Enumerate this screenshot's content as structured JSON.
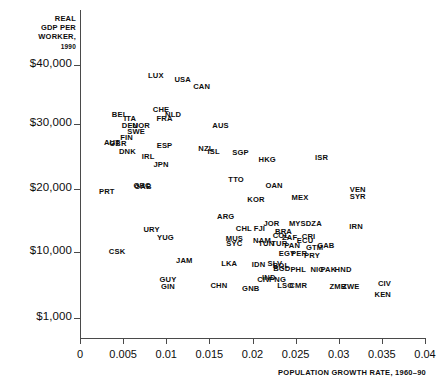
{
  "chart_data": {
    "type": "scatter",
    "title": "",
    "ylabel": "REAL GDP PER WORKER, 1990",
    "ylabel_lines": [
      "REAL",
      "GDP PER",
      "WORKER,"
    ],
    "ylabel_year": "1990",
    "xlabel": "POPULATION GROWTH RATE, 1960–90",
    "xlim": [
      0,
      0.04
    ],
    "ylim": [
      1000,
      40000
    ],
    "grid": false,
    "legend": "none",
    "xticks": [
      0,
      0.005,
      0.01,
      0.015,
      0.02,
      0.025,
      0.03,
      0.035,
      0.04
    ],
    "xticklabels": [
      "0",
      "0.005",
      "0.01",
      "0.015",
      "0.02",
      "0.025",
      "0.03",
      "0.035",
      "0.04"
    ],
    "yticks": [
      40000,
      30000,
      20000,
      10000,
      1000
    ],
    "yticklabels": [
      "$40,000",
      "$30,000",
      "$20,000",
      "$10,000",
      "$1,000"
    ],
    "marker_style": "text-label",
    "points": [
      {
        "label": "LUX",
        "x": 0.0088,
        "y": 38200
      },
      {
        "label": "USA",
        "x": 0.0119,
        "y": 37400
      },
      {
        "label": "CAN",
        "x": 0.0141,
        "y": 36300
      },
      {
        "label": "CHE",
        "x": 0.0094,
        "y": 32300
      },
      {
        "label": "BEL",
        "x": 0.0046,
        "y": 31500
      },
      {
        "label": "NLD",
        "x": 0.0108,
        "y": 31600
      },
      {
        "label": "ITA",
        "x": 0.0058,
        "y": 30900
      },
      {
        "label": "FRA",
        "x": 0.0098,
        "y": 30800
      },
      {
        "label": "DEU",
        "x": 0.0058,
        "y": 29700
      },
      {
        "label": "NOR",
        "x": 0.0071,
        "y": 29700
      },
      {
        "label": "SWE",
        "x": 0.0065,
        "y": 28800
      },
      {
        "label": "FIN",
        "x": 0.0054,
        "y": 27900
      },
      {
        "label": "AUT",
        "x": 0.0037,
        "y": 27100
      },
      {
        "label": "GBR",
        "x": 0.0044,
        "y": 27000
      },
      {
        "label": "ESP",
        "x": 0.0098,
        "y": 26600
      },
      {
        "label": "DNK",
        "x": 0.0055,
        "y": 25700
      },
      {
        "label": "AUS",
        "x": 0.0163,
        "y": 29700
      },
      {
        "label": "IRL",
        "x": 0.0079,
        "y": 24900
      },
      {
        "label": "NZL",
        "x": 0.0146,
        "y": 26100
      },
      {
        "label": "ISL",
        "x": 0.0155,
        "y": 25700
      },
      {
        "label": "SGP",
        "x": 0.0186,
        "y": 25600
      },
      {
        "label": "JPN",
        "x": 0.0094,
        "y": 23700
      },
      {
        "label": "HKG",
        "x": 0.0217,
        "y": 24400
      },
      {
        "label": "ISR",
        "x": 0.028,
        "y": 24700
      },
      {
        "label": "TTO",
        "x": 0.0181,
        "y": 21400
      },
      {
        "label": "OAN",
        "x": 0.0225,
        "y": 20500
      },
      {
        "label": "GRC",
        "x": 0.0072,
        "y": 20400
      },
      {
        "label": "GAB",
        "x": 0.0073,
        "y": 20300
      },
      {
        "label": "PRT",
        "x": 0.0031,
        "y": 19500
      },
      {
        "label": "VEN",
        "x": 0.0322,
        "y": 19900
      },
      {
        "label": "SYR",
        "x": 0.0322,
        "y": 18700
      },
      {
        "label": "KOR",
        "x": 0.0204,
        "y": 18200
      },
      {
        "label": "MEX",
        "x": 0.0255,
        "y": 18600
      },
      {
        "label": "ARG",
        "x": 0.0169,
        "y": 15500
      },
      {
        "label": "URY",
        "x": 0.0083,
        "y": 13500
      },
      {
        "label": "CHL",
        "x": 0.019,
        "y": 13700
      },
      {
        "label": "FJI",
        "x": 0.0208,
        "y": 13700
      },
      {
        "label": "JOR",
        "x": 0.0222,
        "y": 14400
      },
      {
        "label": "MYS",
        "x": 0.0252,
        "y": 14500
      },
      {
        "label": "DZA",
        "x": 0.0271,
        "y": 14400
      },
      {
        "label": "IRN",
        "x": 0.032,
        "y": 14000
      },
      {
        "label": "YUG",
        "x": 0.0099,
        "y": 12200
      },
      {
        "label": "MUS",
        "x": 0.0179,
        "y": 12100
      },
      {
        "label": "SYC",
        "x": 0.0179,
        "y": 11300
      },
      {
        "label": "BRA",
        "x": 0.0236,
        "y": 13100
      },
      {
        "label": "COL",
        "x": 0.0233,
        "y": 12500
      },
      {
        "label": "ZAF",
        "x": 0.0243,
        "y": 12200
      },
      {
        "label": "CRI",
        "x": 0.0265,
        "y": 12400
      },
      {
        "label": "ECU",
        "x": 0.0261,
        "y": 11700
      },
      {
        "label": "NAM",
        "x": 0.0211,
        "y": 11800
      },
      {
        "label": "TUN",
        "x": 0.0216,
        "y": 11300
      },
      {
        "label": "TUR",
        "x": 0.0231,
        "y": 11300
      },
      {
        "label": "PAN",
        "x": 0.0246,
        "y": 10900
      },
      {
        "label": "GTM",
        "x": 0.0272,
        "y": 10700
      },
      {
        "label": "GAB2",
        "x": 0.0285,
        "y": 11000
      },
      {
        "label": "CSK",
        "x": 0.0043,
        "y": 10000
      },
      {
        "label": "EGY",
        "x": 0.024,
        "y": 9700
      },
      {
        "label": "PER",
        "x": 0.0254,
        "y": 9700
      },
      {
        "label": "PRY",
        "x": 0.0269,
        "y": 9500
      },
      {
        "label": "JAM",
        "x": 0.0121,
        "y": 8800
      },
      {
        "label": "LKA",
        "x": 0.0173,
        "y": 8400
      },
      {
        "label": "IDN",
        "x": 0.0207,
        "y": 8200
      },
      {
        "label": "SLV",
        "x": 0.0226,
        "y": 8300
      },
      {
        "label": "BOL",
        "x": 0.0233,
        "y": 8100
      },
      {
        "label": "BGD",
        "x": 0.0234,
        "y": 7700
      },
      {
        "label": "PHL",
        "x": 0.0253,
        "y": 7600
      },
      {
        "label": "NIC",
        "x": 0.0275,
        "y": 7500
      },
      {
        "label": "PAK",
        "x": 0.0288,
        "y": 7500
      },
      {
        "label": "HND",
        "x": 0.0305,
        "y": 7500
      },
      {
        "label": "GUY",
        "x": 0.0102,
        "y": 6200
      },
      {
        "label": "GIN",
        "x": 0.0102,
        "y": 5200
      },
      {
        "label": "CHN",
        "x": 0.0161,
        "y": 5300
      },
      {
        "label": "CIV",
        "x": 0.0213,
        "y": 6200
      },
      {
        "label": "IND",
        "x": 0.0219,
        "y": 6400
      },
      {
        "label": "PNG",
        "x": 0.0229,
        "y": 6200
      },
      {
        "label": "GNB",
        "x": 0.0198,
        "y": 4900
      },
      {
        "label": "LSO",
        "x": 0.0238,
        "y": 5400
      },
      {
        "label": "CMR",
        "x": 0.0253,
        "y": 5400
      },
      {
        "label": "ZMB",
        "x": 0.0299,
        "y": 5200
      },
      {
        "label": "ZWE",
        "x": 0.0314,
        "y": 5200
      },
      {
        "label": "KEN",
        "x": 0.0351,
        "y": 4200
      },
      {
        "label": "CIV2",
        "x": 0.0353,
        "y": 5600
      }
    ]
  },
  "axis": {
    "y_title_lines": [
      "REAL",
      "GDP PER",
      "WORKER,"
    ],
    "y_title_year": "1990",
    "x_title": "POPULATION GROWTH RATE, 1960–90"
  }
}
